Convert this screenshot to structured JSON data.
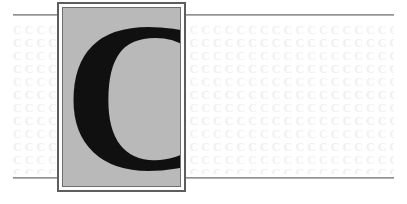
{
  "page": {
    "width": 407,
    "height": 204,
    "background_color": "#ffffff",
    "kind": "decorative-chapter-opener"
  },
  "drop_cap": {
    "letter": "C",
    "box_fill_color": "#b9b9b9",
    "letter_color": "#101010",
    "outer_border_color": "#5d5d5d",
    "inner_border_color": "#6e6e6e",
    "gap_color": "#ffffff"
  },
  "background_pattern": {
    "glyph": "C",
    "color": "#f1f1f1",
    "rows": [
      "CCCCCCCCCCCCCCCCCCCCCCCCCCCCCCCCCCCCCCCCCCCCCCCCCC",
      "CCCCCCCCCCCCCCCCCCCCCCCCCCCCCCCCCCCCCCCCCCCCCCCCCC",
      "CCCCCCCCCCCCCCCCCCCCCCCCCCCCCCCCCCCCCCCCCCCCCCCCCC",
      "CCCCCCCCCCCCCCCCCCCCCCCCCCCCCCCCCCCCCCCCCCCCCCCCCC",
      "CCCCCCCCCCCCCCCCCCCCCCCCCCCCCCCCCCCCCCCCCCCCCCCCCC",
      "CCCCCCCCCCCCCCCCCCCCCCCCCCCCCCCCCCCCCCCCCCCCCCCCCC",
      "CCCCCCCCCCCCCCCCCCCCCCCCCCCCCCCCCCCCCCCCCCCCCCCCCC",
      "CCCCCCCCCCCCCCCCCCCCCCCCCCCCCCCCCCCCCCCCCCCCCCCCCC",
      "CCCCCCCCCCCCCCCCCCCCCCCCCCCCCCCCCCCCCCCCCCCCCCCCCC",
      "CCCCCCCCCCCCCCCCCCCCCCCCCCCCCCCCCCCCCCCCCCCCCCCCCC",
      "CCCCCCCCCCCCCCCCCCCCCCCCCCCCCCCCCCCCCCCCCCCCCCCCCC",
      "CCCCCCCCCCCCCCCCCCCCCCCCCCCCCCCCCCCCCCCCCCCCCCCCCC"
    ]
  },
  "rules": {
    "color": "#8c8c8c",
    "top_left": "",
    "top_right": "",
    "bottom_left": "",
    "bottom_right": ""
  }
}
